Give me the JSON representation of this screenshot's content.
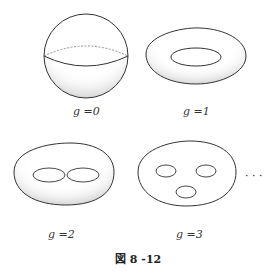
{
  "figure": {
    "caption": "図 8 -12",
    "ellipsis": "· · ·",
    "surfaces": [
      {
        "name": "sphere",
        "label": "g =0",
        "genus": 0
      },
      {
        "name": "torus",
        "label": "g =1",
        "genus": 1
      },
      {
        "name": "double-torus",
        "label": "g =2",
        "genus": 2
      },
      {
        "name": "triple-torus",
        "label": "g =3",
        "genus": 3
      }
    ]
  }
}
